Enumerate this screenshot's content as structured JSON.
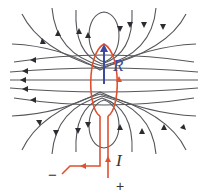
{
  "diagram": {
    "labels": {
      "magnetic_moment": "R",
      "current": "I",
      "minus_terminal": "−",
      "plus_terminal": "+"
    },
    "colors": {
      "field_lines": "#55565b",
      "wire": "#e0502f",
      "moment_vector": "#3a4aa0",
      "background": "#ffffff"
    }
  }
}
